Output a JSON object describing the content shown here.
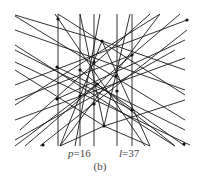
{
  "figure": {
    "points": [
      [
        58,
        19
      ],
      [
        102,
        41
      ],
      [
        57,
        67
      ],
      [
        80,
        70
      ],
      [
        94,
        62
      ],
      [
        132,
        55
      ],
      [
        116,
        76
      ],
      [
        97,
        84
      ],
      [
        57,
        99
      ],
      [
        80,
        96
      ],
      [
        94,
        104
      ],
      [
        117,
        91
      ],
      [
        132,
        110
      ],
      [
        104,
        126
      ],
      [
        187,
        20
      ],
      [
        43,
        145
      ],
      [
        184,
        144
      ]
    ],
    "lines": [
      [
        58,
        14,
        58,
        146
      ],
      [
        80,
        14,
        80,
        146
      ],
      [
        94,
        14,
        94,
        146
      ],
      [
        117,
        14,
        117,
        146
      ],
      [
        132,
        14,
        132,
        146
      ],
      [
        15,
        16,
        185,
        120
      ],
      [
        15,
        30,
        185,
        90
      ],
      [
        15,
        62,
        190,
        145
      ],
      [
        15,
        45,
        175,
        146
      ],
      [
        55,
        14,
        145,
        146
      ],
      [
        58,
        14,
        185,
        95
      ],
      [
        15,
        105,
        160,
        14
      ],
      [
        20,
        130,
        150,
        14
      ],
      [
        25,
        146,
        180,
        14
      ],
      [
        15,
        85,
        187,
        20
      ],
      [
        40,
        146,
        187,
        30
      ],
      [
        15,
        120,
        185,
        58
      ],
      [
        15,
        140,
        175,
        50
      ],
      [
        60,
        146,
        160,
        14
      ],
      [
        100,
        14,
        75,
        146
      ],
      [
        104,
        126,
        80,
        14
      ],
      [
        104,
        126,
        130,
        14
      ],
      [
        104,
        126,
        60,
        146
      ],
      [
        104,
        126,
        150,
        146
      ],
      [
        104,
        126,
        15,
        70
      ],
      [
        104,
        126,
        185,
        100
      ],
      [
        102,
        41,
        60,
        146
      ],
      [
        102,
        41,
        150,
        146
      ],
      [
        102,
        41,
        15,
        15
      ],
      [
        102,
        41,
        185,
        70
      ],
      [
        57,
        67,
        185,
        130
      ],
      [
        57,
        99,
        185,
        40
      ],
      [
        132,
        55,
        15,
        100
      ],
      [
        132,
        110,
        15,
        50
      ],
      [
        97,
        84,
        185,
        146
      ],
      [
        97,
        84,
        15,
        146
      ],
      [
        80,
        70,
        175,
        146
      ]
    ],
    "caption_p_var": "p",
    "caption_p_val": "=16",
    "caption_l_var": "l",
    "caption_l_val": "=37",
    "sublabel": "(b)"
  }
}
